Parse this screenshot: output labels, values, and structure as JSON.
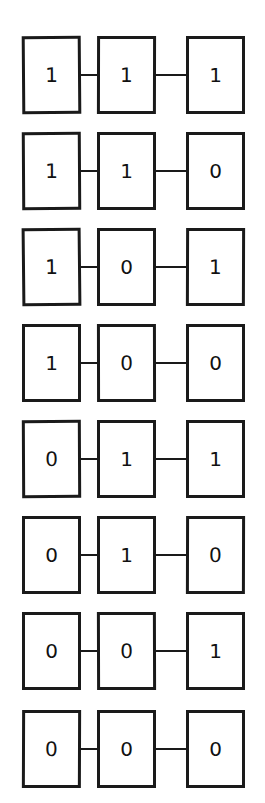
{
  "diagram": {
    "type": "truth-table-chain",
    "row_count": 8,
    "columns_per_row": 3,
    "background_color": "#ffffff",
    "line_color": "#1a1a1a",
    "digit_color": "#111111",
    "rows": [
      {
        "index": 0,
        "bits": [
          "1",
          "1",
          "1"
        ]
      },
      {
        "index": 1,
        "bits": [
          "1",
          "1",
          "0"
        ]
      },
      {
        "index": 2,
        "bits": [
          "1",
          "0",
          "1"
        ]
      },
      {
        "index": 3,
        "bits": [
          "1",
          "0",
          "0"
        ]
      },
      {
        "index": 4,
        "bits": [
          "0",
          "1",
          "1"
        ]
      },
      {
        "index": 5,
        "bits": [
          "0",
          "1",
          "0"
        ]
      },
      {
        "index": 6,
        "bits": [
          "0",
          "0",
          "1"
        ]
      },
      {
        "index": 7,
        "bits": [
          "0",
          "0",
          "0"
        ]
      }
    ],
    "row_tops": [
      36,
      132,
      228,
      324,
      420,
      516,
      612,
      710
    ]
  }
}
